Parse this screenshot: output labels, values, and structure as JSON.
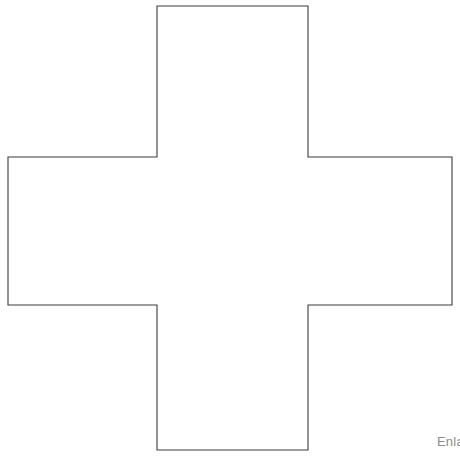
{
  "canvas": {
    "width": 460,
    "height": 456,
    "background_color": "#ffffff"
  },
  "figure": {
    "name": "greek-cross-outline",
    "fill_color": "#ffffff",
    "stroke_color": "#3a3a3a",
    "stroke_width": 1.1,
    "points": "157,6 308,6 308,157 452,157 452,305 308,305 308,450 157,450 157,305 8,305 8,157 157,157",
    "bounds": {
      "left": 8,
      "top": 6,
      "right": 452,
      "bottom": 450
    },
    "arm_width": 151,
    "vertical_extent": 444,
    "horizontal_extent": 444
  },
  "caption": {
    "text": "Enla",
    "color": "#8c8c8c",
    "truncated": true
  }
}
